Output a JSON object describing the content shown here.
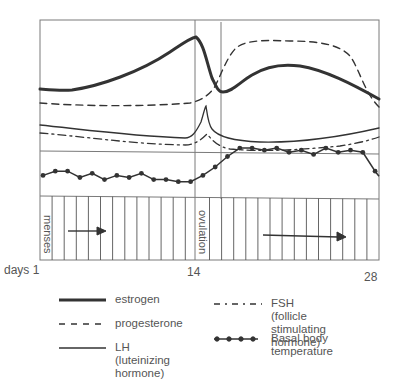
{
  "chart_data": {
    "type": "line",
    "title": "",
    "xlabel": "days",
    "ylabel": "",
    "x_range": [
      1,
      28
    ],
    "x_ticks": [
      {
        "value": 1,
        "label": "days 1"
      },
      {
        "value": 14,
        "label": "14"
      },
      {
        "value": 28,
        "label": "28"
      }
    ],
    "panels": [
      "hormone levels",
      "basal body temperature",
      "cycle phases"
    ],
    "grid": true,
    "legend_position": "bottom",
    "series": [
      {
        "name": "estrogen",
        "style": "thick solid",
        "x": [
          1,
          3,
          5,
          7,
          9,
          11,
          13,
          14,
          15,
          16,
          18,
          20,
          22,
          24,
          26,
          28
        ],
        "values": [
          30,
          29,
          32,
          38,
          46,
          56,
          66,
          72,
          52,
          28,
          40,
          50,
          50,
          45,
          36,
          24
        ]
      },
      {
        "name": "progesterone",
        "style": "dashed",
        "x": [
          1,
          5,
          10,
          14,
          15,
          16,
          17,
          18,
          20,
          24,
          26,
          27,
          28
        ],
        "values": [
          18,
          17,
          17,
          18,
          20,
          38,
          62,
          74,
          76,
          75,
          68,
          50,
          20
        ]
      },
      {
        "name": "LH (luteinizing hormone)",
        "style": "solid",
        "x": [
          1,
          5,
          10,
          13,
          14,
          14.5,
          15,
          16,
          18,
          22,
          26,
          28
        ],
        "values": [
          10,
          7,
          4,
          3,
          8,
          26,
          8,
          2,
          0,
          0,
          2,
          4
        ]
      },
      {
        "name": "FSH (follicle stimulating hormone)",
        "style": "dash-dot",
        "x": [
          1,
          5,
          10,
          13,
          14,
          15,
          16,
          18,
          22,
          26,
          28
        ],
        "values": [
          4,
          2,
          -2,
          -3,
          0,
          4,
          -4,
          -6,
          -5,
          -3,
          0
        ]
      },
      {
        "name": "Basal body temperature",
        "style": "solid with dots",
        "x": [
          1,
          2,
          3,
          4,
          5,
          6,
          7,
          8,
          9,
          10,
          11,
          12,
          13,
          14,
          15,
          16,
          17,
          18,
          19,
          20,
          21,
          22,
          23,
          24,
          25,
          26,
          27,
          28
        ],
        "values": [
          36.3,
          36.4,
          36.4,
          36.25,
          36.35,
          36.2,
          36.3,
          36.25,
          36.35,
          36.2,
          36.2,
          36.15,
          36.15,
          36.3,
          36.5,
          36.75,
          36.95,
          36.95,
          36.9,
          36.95,
          36.85,
          36.9,
          36.8,
          36.95,
          36.85,
          36.9,
          36.85,
          36.4
        ]
      }
    ],
    "annotations": [
      {
        "text": "menses",
        "x": 1,
        "orientation": "vertical"
      },
      {
        "text": "ovulation",
        "x": 14,
        "orientation": "vertical"
      },
      {
        "type": "arrow",
        "from": 3,
        "to": 7,
        "panel": "cycle phases"
      },
      {
        "type": "arrow",
        "from": 18,
        "to": 26,
        "panel": "cycle phases"
      }
    ]
  },
  "labels": {
    "menses": "menses",
    "ovulation": "ovulation",
    "days_1": "days 1",
    "day_14": "14",
    "day_28": "28"
  },
  "legend": {
    "estrogen": "estrogen",
    "progesterone": "progesterone",
    "lh": "LH (luteinizing\nhormone)",
    "fsh": "FSH (follicle\nstimulating hormone)",
    "bbt": "Basal body\ntemperature"
  },
  "colors": {
    "line": "#333333",
    "frame": "#777777",
    "text": "#555555"
  }
}
